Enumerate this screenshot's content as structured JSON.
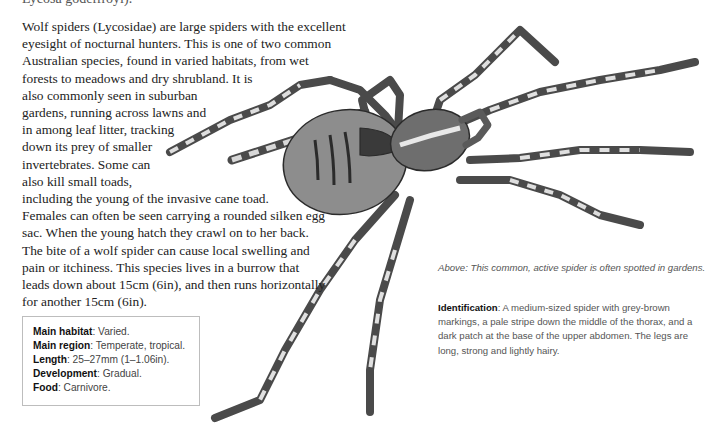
{
  "page": {
    "cut_off_text": "Lycosa godeffroyi).",
    "body_paragraph": "Wolf spiders (Lycosidae) are large spiders with the excellent eyesight of nocturnal hunters. This is one of two common Australian species, found in varied habitats, from wet forests to meadows and dry shrubland. It is also commonly seen in suburban gardens, running across lawns and in among leaf litter, tracking down its prey of smaller invertebrates. Some can also kill small toads, including the young of the invasive cane toad. Females can often be seen carrying a rounded silken egg sac. When the young hatch they crawl on to her back. The bite of a wolf spider can cause local swelling and pain or itchiness. This species lives in a burrow that leads down about 15cm (6in), and then runs horizontally for another 15cm (6in).",
    "fact_box": [
      {
        "label": "Main habitat",
        "value": ": Varied."
      },
      {
        "label": "Main region",
        "value": ": Temperate, tropical."
      },
      {
        "label": "Length",
        "value": ": 25–27mm (1–1.06in)."
      },
      {
        "label": "Development",
        "value": ": Gradual."
      },
      {
        "label": "Food",
        "value": ": Carnivore."
      }
    ],
    "caption": "Above: This common, active spider is often spotted in gardens.",
    "identification": {
      "label": "Identification",
      "text": ": A medium-sized spider with grey-brown markings, a pale stripe down the middle of the thorax, and a dark patch at the base of the upper abdomen. The legs are long, strong and lightly hairy."
    },
    "illustration": {
      "subject": "wolf-spider-illustration",
      "colors": {
        "dark": "#2b2b2b",
        "mid": "#7a7a7a",
        "light": "#e2e2e2"
      }
    }
  }
}
